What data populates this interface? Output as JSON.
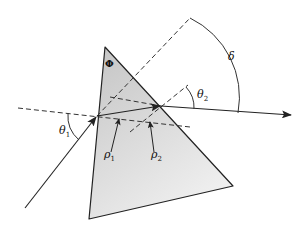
{
  "diagram": {
    "labels": {
      "apex_angle": "Φ",
      "incidence_angle": "θ",
      "incidence_sub": "1",
      "exit_angle": "θ",
      "exit_sub": "2",
      "deviation": "δ",
      "refraction_angle_1": "ρ",
      "refraction_angle_1_sub": "1",
      "refraction_angle_2": "ρ",
      "refraction_angle_2_sub": "2"
    },
    "colors": {
      "prism_fill_top": "#c8c8c8",
      "prism_fill_bottom": "#ececec",
      "line": "#222222",
      "background": "#ffffff"
    }
  }
}
